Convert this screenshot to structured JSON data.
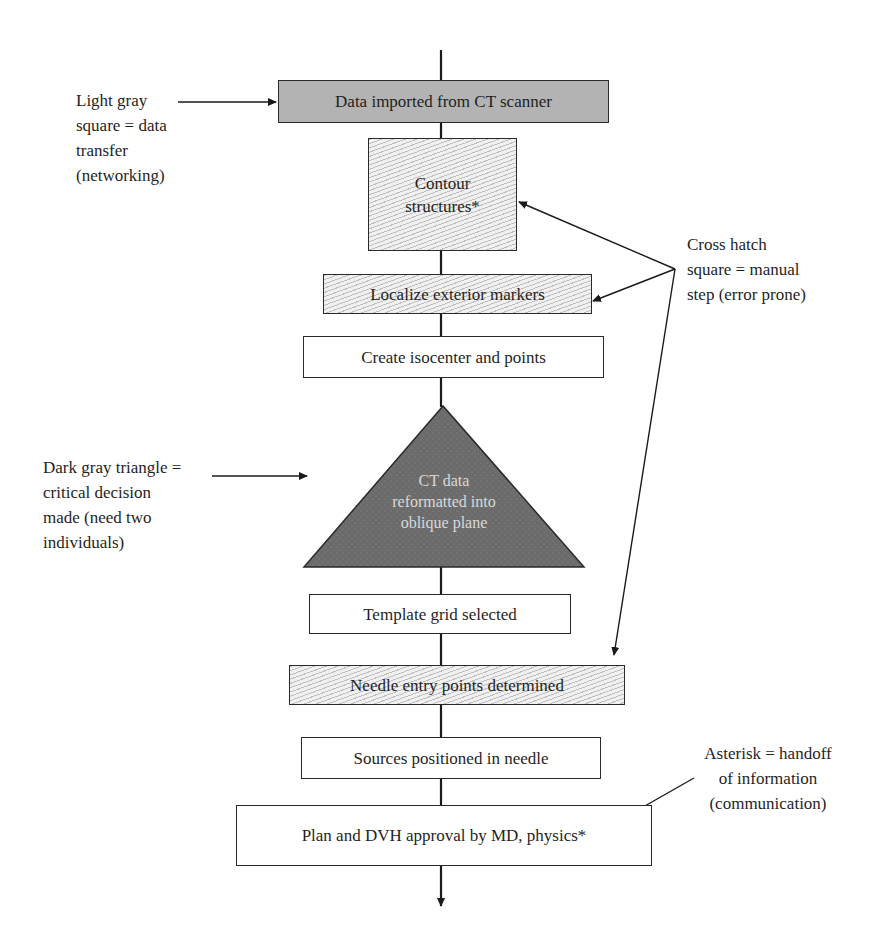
{
  "diagram": {
    "type": "flowchart",
    "steps": [
      {
        "id": "s1",
        "label": "Data imported from CT scanner",
        "category": "data-transfer"
      },
      {
        "id": "s2",
        "label": "Contour structures*",
        "category": "manual-step"
      },
      {
        "id": "s3",
        "label": "Localize exterior markers",
        "category": "manual-step"
      },
      {
        "id": "s4",
        "label": "Create isocenter and points",
        "category": "plain"
      },
      {
        "id": "s5",
        "label": "CT data reformatted into oblique plane",
        "category": "critical-decision"
      },
      {
        "id": "s6",
        "label": "Template grid selected",
        "category": "plain"
      },
      {
        "id": "s7",
        "label": "Needle entry points determined",
        "category": "manual-step"
      },
      {
        "id": "s8",
        "label": "Sources positioned in needle",
        "category": "plain"
      },
      {
        "id": "s9",
        "label": "Plan and DVH approval by MD, physics*",
        "category": "plain"
      }
    ],
    "labels": {
      "contour_line1": "Contour",
      "contour_line2": "structures*",
      "triangle_line1": "CT data",
      "triangle_line2": "reformatted into",
      "triangle_line3": "oblique plane"
    },
    "legend": {
      "light_gray": {
        "lines": [
          "Light gray",
          "square = data",
          "transfer",
          "(networking)"
        ]
      },
      "cross_hatch": {
        "lines": [
          "Cross hatch",
          "square = manual",
          "step (error prone)"
        ]
      },
      "dark_gray": {
        "lines": [
          "Dark gray triangle =",
          "critical decision",
          "made (need two",
          "individuals)"
        ]
      },
      "asterisk": {
        "lines": [
          "Asterisk = handoff",
          "of information",
          "(communication)"
        ]
      }
    },
    "colors": {
      "light_gray_fill": "#b3b3b3",
      "cross_hatch_fill": "#f0f0f0",
      "dark_gray_fill": "#6b6b6b",
      "line": "#1a1a1a"
    }
  }
}
